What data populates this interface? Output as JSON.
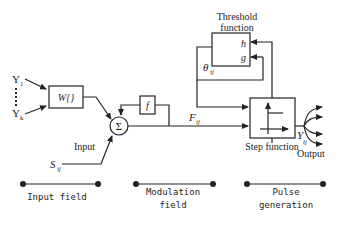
{
  "diagram": {
    "inputs": {
      "y_first": "Y",
      "y_first_sub": "1",
      "y_last": "Y",
      "y_last_sub": "k",
      "weight_box": "W{}",
      "stimulus": "S",
      "stimulus_sub": "ij",
      "input_label": "Input"
    },
    "modulation": {
      "sum_symbol": "Σ",
      "feedback_box": "f",
      "internal_activity": "F",
      "internal_activity_sub": "ij"
    },
    "threshold": {
      "title_line1": "Threshold",
      "title_line2": "function",
      "h_label": "h",
      "g_label": "g",
      "theta": "θ",
      "theta_sub": "ij"
    },
    "step": {
      "label": "Step function"
    },
    "output": {
      "y": "Y",
      "y_sub": "ij",
      "label": "Output"
    },
    "sections": [
      {
        "line1": "Input field",
        "line2": ""
      },
      {
        "line1": "Modulation",
        "line2": "field"
      },
      {
        "line1": "Pulse",
        "line2": "generation"
      }
    ]
  }
}
